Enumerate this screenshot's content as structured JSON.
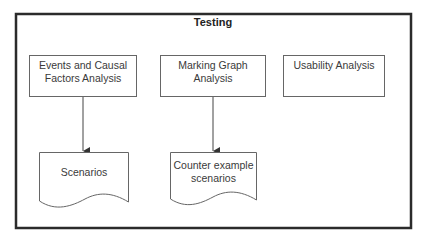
{
  "diagram": {
    "title": "Testing",
    "processes": [
      {
        "id": "p1",
        "label": "Events and Causal Factors Analysis",
        "line1": "Events and Causal",
        "line2": "Factors Analysis"
      },
      {
        "id": "p2",
        "label": "Marking Graph Analysis"
      },
      {
        "id": "p3",
        "label": "Usability Analysis"
      }
    ],
    "documents": [
      {
        "id": "d1",
        "line1": "Scenarios",
        "line2": ""
      },
      {
        "id": "d2",
        "line1": "Counter example",
        "line2": "scenarios"
      }
    ],
    "edges": [
      {
        "from": "Events and Causal Factors Analysis",
        "to": "Scenarios"
      },
      {
        "from": "Marking Graph Analysis",
        "to": "Counter example scenarios"
      }
    ],
    "colors": {
      "frame": "#2b2b2b",
      "box": "#555555",
      "text": "#3a3a3a"
    }
  }
}
